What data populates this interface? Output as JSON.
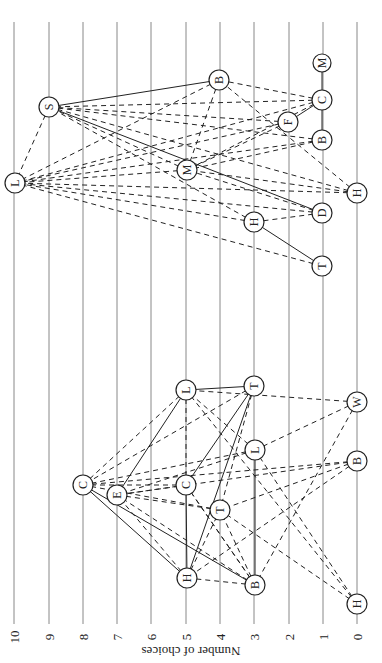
{
  "diagram": {
    "type": "sociogram",
    "orientation": "rotated-90",
    "axis": {
      "label": "Number of choices",
      "ticks": [
        "10",
        "9",
        "8",
        "7",
        "6",
        "5",
        "4",
        "3",
        "2",
        "1",
        "0"
      ]
    },
    "groups": [
      {
        "name": "upper-group",
        "nodes": [
          {
            "id": "L1",
            "label": "L",
            "choices": 10
          },
          {
            "id": "S1",
            "label": "S",
            "choices": 9
          },
          {
            "id": "B1",
            "label": "B",
            "choices": 5
          },
          {
            "id": "M1",
            "label": "M",
            "choices": 1
          },
          {
            "id": "C1",
            "label": "C",
            "choices": 1
          },
          {
            "id": "F1",
            "label": "F",
            "choices": 2
          },
          {
            "id": "B2",
            "label": "B",
            "choices": 1
          },
          {
            "id": "M2",
            "label": "M",
            "choices": 5
          },
          {
            "id": "H1",
            "label": "H",
            "choices": 0
          },
          {
            "id": "D1",
            "label": "D",
            "choices": 1
          },
          {
            "id": "H2",
            "label": "H",
            "choices": 3
          },
          {
            "id": "T1",
            "label": "T",
            "choices": 1
          }
        ]
      },
      {
        "name": "lower-group",
        "nodes": [
          {
            "id": "L3",
            "label": "L",
            "choices": 5
          },
          {
            "id": "T3",
            "label": "T",
            "choices": 3
          },
          {
            "id": "W3",
            "label": "W",
            "choices": 0
          },
          {
            "id": "C3",
            "label": "C",
            "choices": 8
          },
          {
            "id": "E3",
            "label": "E",
            "choices": 7
          },
          {
            "id": "C4",
            "label": "C",
            "choices": 5
          },
          {
            "id": "T4",
            "label": "T",
            "choices": 4
          },
          {
            "id": "L4",
            "label": "L",
            "choices": 3
          },
          {
            "id": "H3",
            "label": "H",
            "choices": 5
          },
          {
            "id": "B3",
            "label": "B",
            "choices": 3
          },
          {
            "id": "B4",
            "label": "B",
            "choices": 0
          },
          {
            "id": "H4",
            "label": "H",
            "choices": 0
          }
        ]
      }
    ]
  }
}
